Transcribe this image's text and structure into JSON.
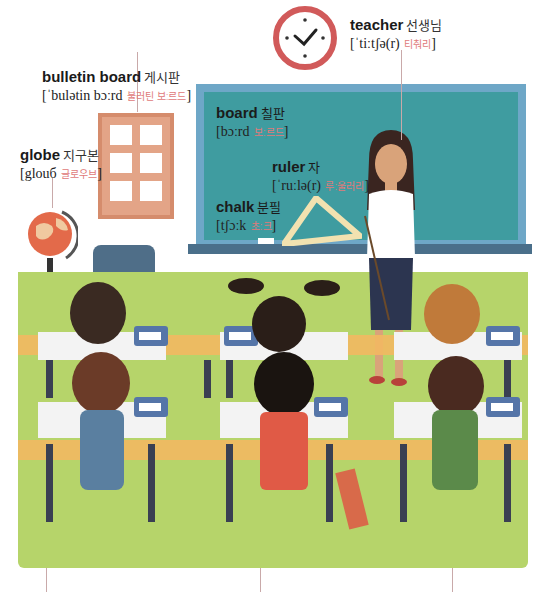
{
  "scene": {
    "title": "Classroom vocabulary illustration",
    "colors": {
      "floor": "#b6d46a",
      "chalkboard": "#3f9ca0",
      "chalkboard_frame": "#6ea7c7",
      "bulletin_board": "#e3a487",
      "clock_rim": "#d15a5a",
      "pronunciation_korean": "#e07a7a"
    }
  },
  "labels": {
    "teacher": {
      "en": "teacher",
      "ko": "선생님",
      "pron": "[ˈtiːtʃə(r)",
      "pron_ko": "티춰리",
      "close": "]"
    },
    "bulletin_board": {
      "en": "bulletin board",
      "ko": "게시판",
      "pron": "[ˈbulətin bɔːrd",
      "pron_ko": "불러틴 보ː르드",
      "close": "]"
    },
    "globe": {
      "en": "globe",
      "ko": "지구본",
      "pron": "[glouб",
      "pron_ko": "글로우브",
      "close": "]"
    },
    "board": {
      "en": "board",
      "ko": "칠판",
      "pron": "[bɔːrd",
      "pron_ko": "보ː르드",
      "close": "]"
    },
    "ruler": {
      "en": "ruler",
      "ko": "자",
      "pron": "[ˈruːlə(r)",
      "pron_ko": "루ː울러리",
      "close": "]"
    },
    "chalk": {
      "en": "chalk",
      "ko": "분필",
      "pron": "[tʃɔːk",
      "pron_ko": "초ː크",
      "close": "]"
    }
  }
}
